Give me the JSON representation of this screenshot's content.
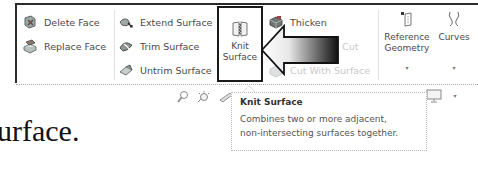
{
  "ribbon": {
    "column1": [
      {
        "label": "Delete Face",
        "icon": "delete-face-icon",
        "enabled": true
      },
      {
        "label": "Replace Face",
        "icon": "replace-face-icon",
        "enabled": true
      }
    ],
    "column2": [
      {
        "label": "Extend Surface",
        "icon": "extend-surface-icon",
        "enabled": true
      },
      {
        "label": "Trim Surface",
        "icon": "trim-surface-icon",
        "enabled": true
      },
      {
        "label": "Untrim Surface",
        "icon": "untrim-surface-icon",
        "enabled": true
      }
    ],
    "knit": {
      "line1": "Knit",
      "line2": "Surface",
      "icon": "knit-surface-icon",
      "highlighted": true
    },
    "column3": [
      {
        "label": "Thicken",
        "icon": "thicken-icon",
        "enabled": true
      },
      {
        "label": "Cut",
        "icon": "cut-icon",
        "enabled": false
      },
      {
        "label": "Cut With Surface",
        "icon": "cut-with-surface-icon",
        "enabled": false
      }
    ],
    "reference_geometry": {
      "line1": "Reference",
      "line2": "Geometry",
      "icon": "reference-geometry-icon",
      "dropdown": "▾"
    },
    "curves": {
      "label": "Curves",
      "icon": "curves-icon",
      "dropdown": "▾"
    }
  },
  "annotation_arrow": {
    "direction": "left",
    "colors": [
      "#ffffff",
      "#111111"
    ]
  },
  "view_toolbar": {
    "icons": [
      "zoom-icon",
      "lighting-icon",
      "section-view-icon"
    ],
    "display_icon": "monitor-icon",
    "dropdown": "▾"
  },
  "tooltip": {
    "title": "Knit Surface",
    "line1": "Combines two or more adjacent,",
    "line2": "non-intersecting surfaces together."
  },
  "document_text": "urface."
}
